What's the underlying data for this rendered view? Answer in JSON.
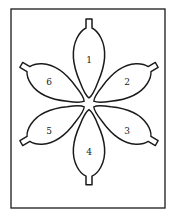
{
  "diagram": {
    "center": [
      89,
      104
    ],
    "petals": [
      {
        "label": "1",
        "angle": -90
      },
      {
        "label": "2",
        "angle": -30
      },
      {
        "label": "3",
        "angle": 30
      },
      {
        "label": "4",
        "angle": 90
      },
      {
        "label": "5",
        "angle": 150
      },
      {
        "label": "6",
        "angle": 210
      }
    ],
    "colors": {
      "stroke": "#1a1a1a",
      "background": "#ffffff"
    }
  }
}
